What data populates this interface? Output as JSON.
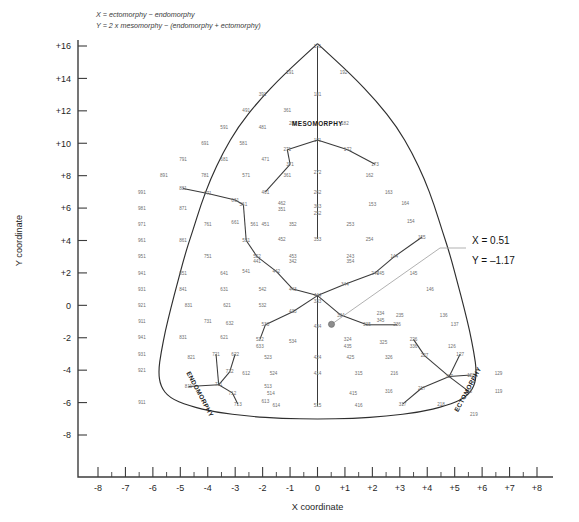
{
  "formula": {
    "line1": "X = ectomorphy − endomorphy",
    "line2": "Y = 2 x mesomorphy − (endomorphy + ectomorphy)"
  },
  "axes": {
    "x_title": "X coordinate",
    "y_title": "Y coordinate",
    "x_ticks": [
      "-8",
      "-7",
      "-6",
      "-5",
      "-4",
      "-3",
      "-2",
      "-1",
      "0",
      "+1",
      "+2",
      "+3",
      "+4",
      "+5",
      "+6",
      "+7",
      "+8"
    ],
    "y_ticks": [
      "+16",
      "+14",
      "+12",
      "+10",
      "+8",
      "+6",
      "+4",
      "+2",
      "0",
      "-2",
      "-4",
      "-6",
      "-8"
    ],
    "x_range": [
      -8,
      8
    ],
    "y_range": [
      -9,
      17
    ],
    "x_minor_step": 0.5
  },
  "somatotype_labels": {
    "mesomorphy": "MESOMORPHY",
    "endomorphy": "ENDOMORPHY",
    "ectomorphy": "ECTOMORPHY"
  },
  "annotation": {
    "x_label": "X = 0.51",
    "y_label": "Y = –1.17"
  },
  "chart_data": {
    "type": "scatter",
    "xlabel": "X coordinate",
    "ylabel": "Y coordinate",
    "xlim": [
      -8,
      8
    ],
    "ylim": [
      -9,
      17
    ],
    "grid": false,
    "legend": null,
    "point": {
      "x": 0.51,
      "y": -1.17,
      "label": "X = 0.51 / Y = –1.17"
    },
    "marker_color": "#8d8d8d",
    "nodes": [
      {
        "code": "191",
        "x": 0,
        "y": 16
      },
      {
        "code": "291",
        "x": -1.0,
        "y": 14.4
      },
      {
        "code": "192",
        "x": 0.95,
        "y": 14.4
      },
      {
        "code": "391",
        "x": -2.0,
        "y": 13.0
      },
      {
        "code": "181",
        "x": 0,
        "y": 13.0
      },
      {
        "code": "491",
        "x": -2.6,
        "y": 12.0
      },
      {
        "code": "361",
        "x": -1.1,
        "y": 12.0
      },
      {
        "code": "591",
        "x": -3.4,
        "y": 11.0
      },
      {
        "code": "481",
        "x": -2.0,
        "y": 11.0
      },
      {
        "code": "281",
        "x": -0.9,
        "y": 11.2
      },
      {
        "code": "182",
        "x": 1.0,
        "y": 11.2
      },
      {
        "code": "691",
        "x": -4.1,
        "y": 10.0
      },
      {
        "code": "581",
        "x": -2.7,
        "y": 10.0
      },
      {
        "code": "171",
        "x": 0,
        "y": 10.2
      },
      {
        "code": "172",
        "x": 1.1,
        "y": 9.6
      },
      {
        "code": "271",
        "x": -1.1,
        "y": 9.6
      },
      {
        "code": "791",
        "x": -4.9,
        "y": 9.0
      },
      {
        "code": "681",
        "x": -3.4,
        "y": 9.0
      },
      {
        "code": "471",
        "x": -1.9,
        "y": 9.0
      },
      {
        "code": "371",
        "x": -1.0,
        "y": 8.7
      },
      {
        "code": "173",
        "x": 2.1,
        "y": 8.7
      },
      {
        "code": "891",
        "x": -5.6,
        "y": 8.0
      },
      {
        "code": "781",
        "x": -4.1,
        "y": 8.0
      },
      {
        "code": "571",
        "x": -2.6,
        "y": 8.0
      },
      {
        "code": "361b",
        "x": -1.1,
        "y": 8.0
      },
      {
        "code": "272",
        "x": 0,
        "y": 8.2
      },
      {
        "code": "162",
        "x": 1.9,
        "y": 8.0
      },
      {
        "code": "991",
        "x": -6.4,
        "y": 7.0
      },
      {
        "code": "881",
        "x": -4.9,
        "y": 7.2
      },
      {
        "code": "771",
        "x": -4.0,
        "y": 6.9
      },
      {
        "code": "661",
        "x": -3.0,
        "y": 6.5
      },
      {
        "code": "461",
        "x": -1.9,
        "y": 7.0
      },
      {
        "code": "262",
        "x": 0,
        "y": 7.0
      },
      {
        "code": "163",
        "x": 2.6,
        "y": 7.0
      },
      {
        "code": "981",
        "x": -6.4,
        "y": 6.0
      },
      {
        "code": "871",
        "x": -4.9,
        "y": 6.0
      },
      {
        "code": "561",
        "x": -2.7,
        "y": 6.2
      },
      {
        "code": "462",
        "x": -1.3,
        "y": 6.3
      },
      {
        "code": "351",
        "x": -1.3,
        "y": 5.9
      },
      {
        "code": "363",
        "x": 0,
        "y": 6.1
      },
      {
        "code": "252",
        "x": 0,
        "y": 5.7
      },
      {
        "code": "153",
        "x": 2.0,
        "y": 6.2
      },
      {
        "code": "164",
        "x": 3.2,
        "y": 6.3
      },
      {
        "code": "971",
        "x": -6.4,
        "y": 5.0
      },
      {
        "code": "761",
        "x": -4.0,
        "y": 5.0
      },
      {
        "code": "661b",
        "x": -3.0,
        "y": 5.1
      },
      {
        "code": "561b",
        "x": -2.3,
        "y": 5.0
      },
      {
        "code": "451",
        "x": -1.9,
        "y": 5.0
      },
      {
        "code": "352",
        "x": -0.9,
        "y": 5.0
      },
      {
        "code": "253",
        "x": 1.2,
        "y": 5.0
      },
      {
        "code": "154",
        "x": 3.4,
        "y": 5.2
      },
      {
        "code": "961",
        "x": -6.4,
        "y": 4.0
      },
      {
        "code": "861",
        "x": -4.9,
        "y": 4.0
      },
      {
        "code": "551",
        "x": -2.6,
        "y": 4.0
      },
      {
        "code": "452",
        "x": -1.3,
        "y": 4.1
      },
      {
        "code": "353",
        "x": 0,
        "y": 4.1
      },
      {
        "code": "254",
        "x": 1.9,
        "y": 4.1
      },
      {
        "code": "155",
        "x": 3.8,
        "y": 4.2
      },
      {
        "code": "951",
        "x": -6.4,
        "y": 3.0
      },
      {
        "code": "751",
        "x": -4.0,
        "y": 3.0
      },
      {
        "code": "552",
        "x": -2.2,
        "y": 3.0
      },
      {
        "code": "441",
        "x": -2.2,
        "y": 2.7
      },
      {
        "code": "453",
        "x": -0.9,
        "y": 3.0
      },
      {
        "code": "342",
        "x": -0.9,
        "y": 2.7
      },
      {
        "code": "243",
        "x": 1.2,
        "y": 3.0
      },
      {
        "code": "354",
        "x": 1.2,
        "y": 2.7
      },
      {
        "code": "144",
        "x": 2.8,
        "y": 3.0
      },
      {
        "code": "941",
        "x": -6.4,
        "y": 2.0
      },
      {
        "code": "851",
        "x": -4.9,
        "y": 2.0
      },
      {
        "code": "641",
        "x": -3.4,
        "y": 2.0
      },
      {
        "code": "541",
        "x": -2.6,
        "y": 2.1
      },
      {
        "code": "442",
        "x": -1.5,
        "y": 2.1
      },
      {
        "code": "244",
        "x": 2.1,
        "y": 2.0
      },
      {
        "code": "245",
        "x": 2.3,
        "y": 2.0
      },
      {
        "code": "145",
        "x": 3.5,
        "y": 2.0
      },
      {
        "code": "931",
        "x": -6.4,
        "y": 1.0
      },
      {
        "code": "841",
        "x": -4.9,
        "y": 1.0
      },
      {
        "code": "631",
        "x": -3.4,
        "y": 1.0
      },
      {
        "code": "542",
        "x": -2.0,
        "y": 1.0
      },
      {
        "code": "443",
        "x": -0.9,
        "y": 1.0
      },
      {
        "code": "444",
        "x": 0,
        "y": 0.6
      },
      {
        "code": "333",
        "x": 0,
        "y": 0.25
      },
      {
        "code": "344",
        "x": 1.0,
        "y": 1.3
      },
      {
        "code": "146",
        "x": 4.1,
        "y": 1.0
      },
      {
        "code": "921",
        "x": -6.4,
        "y": 0.0
      },
      {
        "code": "831",
        "x": -4.7,
        "y": 0.0
      },
      {
        "code": "621",
        "x": -3.3,
        "y": 0.0
      },
      {
        "code": "532",
        "x": -2.0,
        "y": 0.0
      },
      {
        "code": "433",
        "x": -0.9,
        "y": -0.4
      },
      {
        "code": "334",
        "x": 0.85,
        "y": -0.6
      },
      {
        "code": "234",
        "x": 2.3,
        "y": -0.5
      },
      {
        "code": "345",
        "x": 2.3,
        "y": -0.9
      },
      {
        "code": "235",
        "x": 3.0,
        "y": -0.6
      },
      {
        "code": "136",
        "x": 4.6,
        "y": -0.6
      },
      {
        "code": "911",
        "x": -6.4,
        "y": -1.0
      },
      {
        "code": "731",
        "x": -4.0,
        "y": -1.0
      },
      {
        "code": "632",
        "x": -3.2,
        "y": -1.1
      },
      {
        "code": "533",
        "x": -1.9,
        "y": -1.2
      },
      {
        "code": "434",
        "x": 0,
        "y": -1.3
      },
      {
        "code": "335",
        "x": 1.8,
        "y": -1.2
      },
      {
        "code": "236",
        "x": 2.9,
        "y": -1.2
      },
      {
        "code": "137",
        "x": 5.0,
        "y": -1.2
      },
      {
        "code": "941b",
        "x": -6.4,
        "y": -2.0
      },
      {
        "code": "831b",
        "x": -4.9,
        "y": -2.0
      },
      {
        "code": "621b",
        "x": -3.4,
        "y": -2.0
      },
      {
        "code": "522",
        "x": -2.1,
        "y": -2.1
      },
      {
        "code": "633",
        "x": -2.1,
        "y": -2.5
      },
      {
        "code": "534",
        "x": -0.9,
        "y": -2.2
      },
      {
        "code": "324",
        "x": 1.1,
        "y": -2.1
      },
      {
        "code": "435",
        "x": 1.1,
        "y": -2.5
      },
      {
        "code": "325",
        "x": 2.4,
        "y": -2.3
      },
      {
        "code": "226",
        "x": 3.5,
        "y": -2.1
      },
      {
        "code": "336",
        "x": 3.5,
        "y": -2.5
      },
      {
        "code": "126",
        "x": 4.9,
        "y": -2.5
      },
      {
        "code": "931b",
        "x": -6.4,
        "y": -3.0
      },
      {
        "code": "821",
        "x": -4.6,
        "y": -3.2
      },
      {
        "code": "721",
        "x": -3.7,
        "y": -3.0
      },
      {
        "code": "622",
        "x": -3.0,
        "y": -3.0
      },
      {
        "code": "523",
        "x": -1.8,
        "y": -3.2
      },
      {
        "code": "424",
        "x": 0,
        "y": -3.2
      },
      {
        "code": "425",
        "x": 1.2,
        "y": -3.2
      },
      {
        "code": "326",
        "x": 2.6,
        "y": -3.2
      },
      {
        "code": "227",
        "x": 3.9,
        "y": -3.1
      },
      {
        "code": "127",
        "x": 5.2,
        "y": -3.0
      },
      {
        "code": "921b",
        "x": -6.4,
        "y": -4.0
      },
      {
        "code": "722",
        "x": -3.2,
        "y": -4.1
      },
      {
        "code": "612",
        "x": -2.6,
        "y": -4.2
      },
      {
        "code": "524",
        "x": -1.6,
        "y": -4.2
      },
      {
        "code": "414",
        "x": 0,
        "y": -4.2
      },
      {
        "code": "315",
        "x": 1.5,
        "y": -4.2
      },
      {
        "code": "216",
        "x": 2.8,
        "y": -4.2
      },
      {
        "code": "117",
        "x": 4.8,
        "y": -4.4
      },
      {
        "code": "128",
        "x": 5.6,
        "y": -4.3
      },
      {
        "code": "129",
        "x": 6.6,
        "y": -4.2
      },
      {
        "code": "811",
        "x": -4.7,
        "y": -5.0
      },
      {
        "code": "711",
        "x": -3.6,
        "y": -4.9
      },
      {
        "code": "712",
        "x": -3.1,
        "y": -5.4
      },
      {
        "code": "513",
        "x": -1.8,
        "y": -5.0
      },
      {
        "code": "514",
        "x": -1.7,
        "y": -5.4
      },
      {
        "code": "415",
        "x": 1.3,
        "y": -5.4
      },
      {
        "code": "316",
        "x": 2.6,
        "y": -5.3
      },
      {
        "code": "217",
        "x": 3.8,
        "y": -5.1
      },
      {
        "code": "118",
        "x": 5.5,
        "y": -5.3
      },
      {
        "code": "119",
        "x": 6.6,
        "y": -5.3
      },
      {
        "code": "911b",
        "x": -6.4,
        "y": -6.0
      },
      {
        "code": "713",
        "x": -2.9,
        "y": -6.1
      },
      {
        "code": "613",
        "x": -1.9,
        "y": -5.9
      },
      {
        "code": "614",
        "x": -1.5,
        "y": -6.2
      },
      {
        "code": "515",
        "x": 0,
        "y": -6.2
      },
      {
        "code": "416",
        "x": 1.5,
        "y": -6.2
      },
      {
        "code": "317",
        "x": 3.1,
        "y": -6.1
      },
      {
        "code": "218",
        "x": 4.5,
        "y": -6.1
      },
      {
        "code": "219",
        "x": 5.7,
        "y": -6.7
      }
    ]
  }
}
